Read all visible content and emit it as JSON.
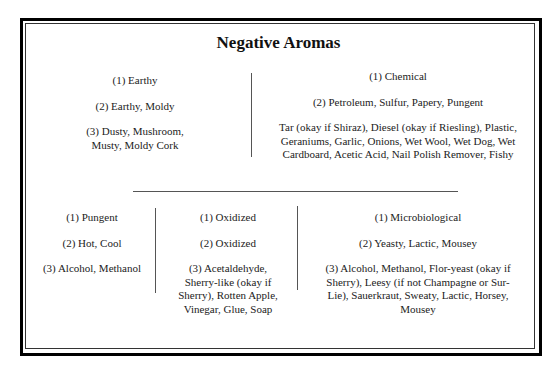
{
  "title": "Negative Aromas",
  "top_row": [
    {
      "lines": [
        "(1) Earthy",
        "(2) Earthy, Moldy",
        "(3) Dusty, Mushroom, Musty, Moldy Cork"
      ]
    },
    {
      "lines": [
        "(1) Chemical",
        "(2) Petroleum, Sulfur, Papery, Pungent",
        "Tar (okay if Shiraz), Diesel (okay if Riesling), Plastic, Geraniums, Garlic, Onions, Wet Wool, Wet Dog, Wet Cardboard, Acetic Acid, Nail Polish Remover, Fishy"
      ]
    }
  ],
  "bottom_row": [
    {
      "lines": [
        "(1) Pungent",
        "(2) Hot, Cool",
        "(3) Alcohol, Methanol"
      ]
    },
    {
      "lines": [
        "(1) Oxidized",
        "(2) Oxidized",
        "(3) Acetaldehyde, Sherry-like (okay if Sherry), Rotten Apple, Vinegar, Glue, Soap"
      ]
    },
    {
      "lines": [
        "(1) Microbiological",
        "(2) Yeasty, Lactic, Mousey",
        "(3) Alcohol, Methanol, Flor-yeast (okay if Sherry), Leesy (if not Champagne or Sur-Lie), Sauerkraut, Sweaty, Lactic, Horsey, Mousey"
      ]
    }
  ]
}
